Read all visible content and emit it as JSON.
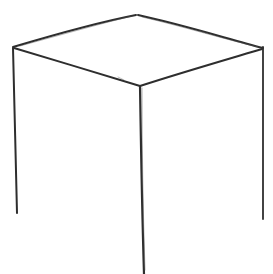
{
  "drawing": {
    "subject": "pencil sketch of an open cube (box wireframe, no bottom edges)",
    "stroke_color": "#2e2e2e",
    "background": "#ffffff",
    "vertices": {
      "top": [
        136,
        15
      ],
      "left": [
        13,
        47
      ],
      "right": [
        263,
        48
      ],
      "front": [
        140,
        86
      ],
      "left_bottom": [
        17,
        213
      ],
      "front_bottom": [
        144,
        274
      ],
      "right_bottom": [
        263,
        219
      ]
    }
  }
}
